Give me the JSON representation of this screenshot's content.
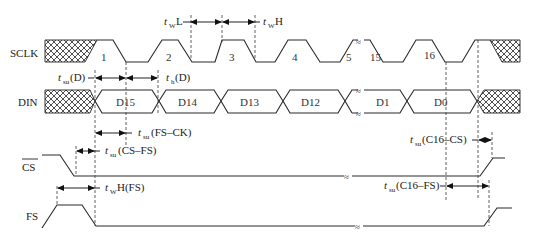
{
  "signals": {
    "sclk": "SCLK",
    "din": "DIN",
    "cs": "CS",
    "fs": "FS"
  },
  "clock_numbers": [
    "1",
    "2",
    "3",
    "4",
    "5",
    "15",
    "16"
  ],
  "data_bits": [
    "D15",
    "D14",
    "D13",
    "D12",
    "D1",
    "D0"
  ],
  "timing": {
    "twL": {
      "t": "t",
      "sub": "W",
      "rest": "L"
    },
    "twH": {
      "t": "t",
      "sub": "W",
      "rest": "H"
    },
    "tsuD": {
      "t": "t",
      "sub": "su",
      "rest": "(D)"
    },
    "thD": {
      "t": "t",
      "sub": "h",
      "rest": "(D)"
    },
    "tsuFSCK": {
      "t": "t",
      "sub": "su",
      "rest": "(FS–CK)"
    },
    "tsuCSFS": {
      "t": "t",
      "sub": "su",
      "rest": "(CS–FS)"
    },
    "twHFS": {
      "t": "t",
      "sub": "W",
      "rest": "H(FS)"
    },
    "tsuC16CS": {
      "t": "t",
      "sub": "su",
      "rest": "(C16–CS)"
    },
    "tsuC16FS": {
      "t": "t",
      "sub": "su",
      "rest": "(C16–FS)"
    }
  },
  "break_symbol": "≈"
}
